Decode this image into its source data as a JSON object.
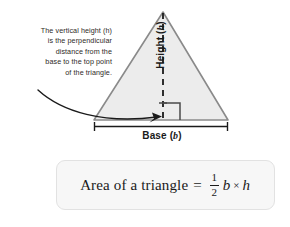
{
  "diagram": {
    "annotation": {
      "lines": [
        "The vertical height (h)",
        "is the perpendicular",
        "distance from the",
        "base to the top point",
        "of the triangle."
      ],
      "full_text": "The vertical height (h) is the perpendicular distance from the base to the top point of the triangle.",
      "variable": "h"
    },
    "height_label": {
      "text": "Height",
      "variable": "h",
      "open_paren": "(",
      "close_paren": ")",
      "orientation": "vertical-rotated-90ccw"
    },
    "base_label": {
      "text": "Base",
      "variable": "b",
      "open_paren": "(",
      "close_paren": ")"
    },
    "shape": {
      "name": "triangle",
      "fill_color": "#ececec",
      "stroke_color": "#8a8a8a",
      "apex": [
        163,
        12
      ],
      "base_left": [
        94,
        120
      ],
      "base_right": [
        228,
        120
      ]
    },
    "height_line": {
      "style": "dashed",
      "color": "#1a1a1a",
      "from": [
        163,
        12
      ],
      "to": [
        163,
        120
      ]
    },
    "right_angle_marker": {
      "color": "#4a4a4a",
      "size": 17
    },
    "dimension_line": {
      "color": "#1a1a1a",
      "from": [
        94,
        126
      ],
      "to": [
        228,
        126
      ],
      "tick_style": "end-serifs"
    },
    "callout_arrow": {
      "color": "#1a1a1a",
      "from": [
        38,
        90
      ],
      "to": [
        161,
        117
      ],
      "style": "curved-with-arrowhead"
    }
  },
  "formula": {
    "label": "Area of a triangle",
    "equals": "=",
    "fraction": {
      "numerator": "1",
      "denominator": "2"
    },
    "base_var": "b",
    "times": "×",
    "height_var": "h",
    "plain": "Area of a triangle = 1/2 b × h",
    "box_bg": "#f7f7f7",
    "box_border": "#e2e2e2"
  }
}
